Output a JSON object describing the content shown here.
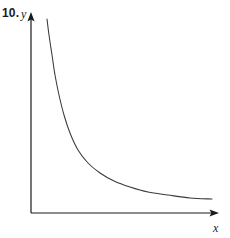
{
  "figure": {
    "problem_number": "10.",
    "y_axis_label": "y",
    "x_axis_label": "x",
    "stroke_color": "#3a3a3a",
    "axis_color": "#1a1a1a",
    "background_color": "#ffffff"
  },
  "chart_data": {
    "type": "line",
    "title": "",
    "subtitle": "",
    "xlabel": "x",
    "ylabel": "y",
    "grid": false,
    "legend": null,
    "annotations": [
      "10."
    ],
    "axis_origin_px": [
      31,
      213
    ],
    "x_axis_end_px": [
      218,
      213
    ],
    "y_axis_end_px": [
      31,
      14
    ],
    "xlim": [
      0,
      10
    ],
    "ylim": [
      0,
      10
    ],
    "x": [
      0.9,
      1.0,
      1.2,
      1.4,
      1.6,
      1.8,
      2.0,
      2.4,
      2.8,
      3.2,
      3.8,
      4.4,
      5.2,
      6.0,
      7.0,
      8.0,
      9.0,
      9.8
    ],
    "y": [
      9.8,
      8.9,
      7.2,
      6.0,
      5.1,
      4.4,
      3.9,
      3.15,
      2.65,
      2.3,
      1.9,
      1.65,
      1.38,
      1.2,
      1.03,
      0.91,
      0.82,
      0.76
    ],
    "curve_points_px": [
      [
        47,
        19
      ],
      [
        49,
        35
      ],
      [
        52,
        55
      ],
      [
        55,
        75
      ],
      [
        59,
        95
      ],
      [
        64,
        115
      ],
      [
        70,
        133
      ],
      [
        78,
        150
      ],
      [
        88,
        163
      ],
      [
        100,
        173
      ],
      [
        114,
        181
      ],
      [
        130,
        187
      ],
      [
        148,
        192
      ],
      [
        168,
        195
      ],
      [
        190,
        198
      ],
      [
        212,
        199
      ]
    ]
  }
}
